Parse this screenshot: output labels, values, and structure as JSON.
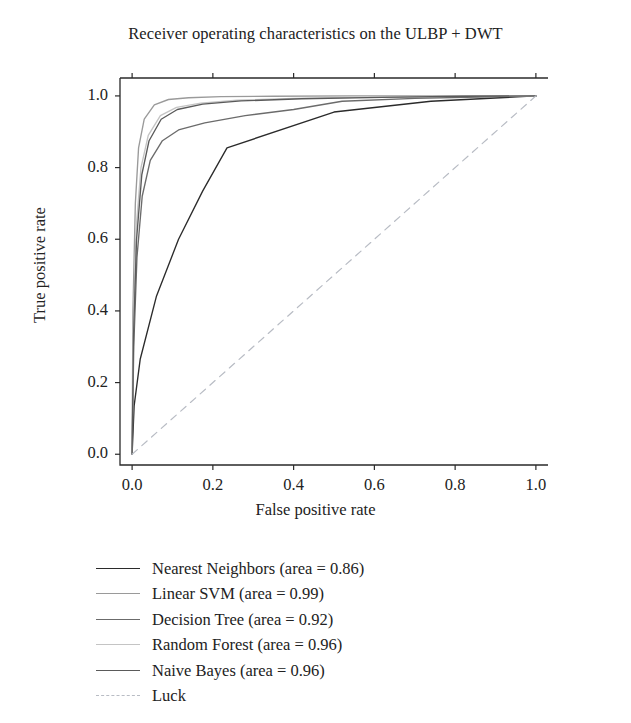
{
  "chart_data": {
    "type": "line",
    "title": "Receiver operating characteristics on the ULBP + DWT",
    "xlabel": "False positive rate",
    "ylabel": "True positive rate",
    "xlim": [
      -0.03,
      1.03
    ],
    "ylim": [
      -0.03,
      1.05
    ],
    "xticks": [
      "0.0",
      "0.2",
      "0.4",
      "0.6",
      "0.8",
      "1.0"
    ],
    "xtick_values": [
      0.0,
      0.2,
      0.4,
      0.6,
      0.8,
      1.0
    ],
    "yticks": [
      "0.0",
      "0.2",
      "0.4",
      "0.6",
      "0.8",
      "1.0"
    ],
    "ytick_values": [
      0.0,
      0.2,
      0.4,
      0.6,
      0.8,
      1.0
    ],
    "grid": false,
    "legend_position": "below-axes-left",
    "series": [
      {
        "name": "Nearest Neighbors",
        "legend_label": "Nearest Neighbors (area = 0.86)",
        "area": 0.86,
        "color": "#2b2b2b",
        "dash": "solid",
        "x": [
          0.0,
          0.005,
          0.02,
          0.06,
          0.115,
          0.175,
          0.235,
          0.5,
          0.74,
          1.0
        ],
        "y": [
          0.0,
          0.135,
          0.265,
          0.44,
          0.6,
          0.735,
          0.855,
          0.955,
          0.985,
          1.0
        ]
      },
      {
        "name": "Linear SVM",
        "legend_label": "Linear SVM (area = 0.99)",
        "area": 0.99,
        "color": "#9a9a9a",
        "dash": "solid",
        "x": [
          0.0,
          0.002,
          0.008,
          0.016,
          0.03,
          0.055,
          0.09,
          0.14,
          0.22,
          0.35,
          0.55,
          0.78,
          1.0
        ],
        "y": [
          0.0,
          0.4,
          0.7,
          0.855,
          0.935,
          0.975,
          0.99,
          0.995,
          0.998,
          0.999,
          1.0,
          1.0,
          1.0
        ]
      },
      {
        "name": "Decision Tree",
        "legend_label": "Decision Tree (area = 0.92)",
        "area": 0.92,
        "color": "#6b6b6b",
        "dash": "solid",
        "x": [
          0.0,
          0.004,
          0.012,
          0.025,
          0.045,
          0.075,
          0.115,
          0.18,
          0.28,
          0.4,
          0.52,
          0.7,
          0.86,
          1.0
        ],
        "y": [
          0.0,
          0.3,
          0.55,
          0.72,
          0.82,
          0.875,
          0.905,
          0.925,
          0.945,
          0.962,
          0.985,
          0.993,
          0.997,
          1.0
        ]
      },
      {
        "name": "Random Forest",
        "legend_label": "Random Forest (area = 0.96)",
        "area": 0.96,
        "color": "#c4c4c4",
        "dash": "solid",
        "x": [
          0.0,
          0.003,
          0.01,
          0.022,
          0.04,
          0.07,
          0.11,
          0.17,
          0.26,
          0.4,
          0.6,
          0.8,
          1.0
        ],
        "y": [
          0.0,
          0.345,
          0.63,
          0.8,
          0.89,
          0.945,
          0.968,
          0.98,
          0.988,
          0.993,
          0.997,
          0.999,
          1.0
        ]
      },
      {
        "name": "Naive Bayes",
        "legend_label": "Naive Bayes (area = 0.96)",
        "area": 0.96,
        "color": "#5a5a5a",
        "dash": "solid",
        "x": [
          0.0,
          0.0035,
          0.011,
          0.024,
          0.042,
          0.072,
          0.112,
          0.175,
          0.27,
          0.42,
          0.62,
          0.82,
          1.0
        ],
        "y": [
          0.0,
          0.33,
          0.6,
          0.78,
          0.875,
          0.935,
          0.962,
          0.977,
          0.986,
          0.992,
          0.996,
          0.999,
          1.0
        ]
      },
      {
        "name": "Luck",
        "legend_label": "Luck",
        "area": null,
        "color": "#b8bcc4",
        "dash": "dashed",
        "x": [
          0.0,
          1.0
        ],
        "y": [
          0.0,
          1.0
        ]
      }
    ]
  }
}
